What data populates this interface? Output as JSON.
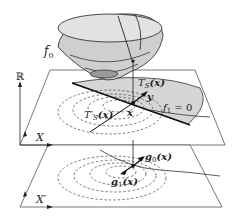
{
  "diagram": {
    "labels": {
      "f0": "f",
      "f0_sub": "0",
      "reals": "ℝ",
      "X": "X",
      "X_prime": "X′",
      "TS": "T",
      "TS_sub": "S",
      "TS_arg": "(x)",
      "TS_prime": "T′",
      "TS_prime_sub": "S",
      "TS_prime_arg": "(x)",
      "y": "y",
      "x": "x",
      "f1_eq": "f",
      "f1_sub": "1",
      "f1_rhs": " = 0",
      "g0": "g",
      "g0_sub": "0",
      "g0_arg": "(x)",
      "g1": "g",
      "g1_sub": "1",
      "g1_arg": "(x)"
    },
    "colors": {
      "surface_fill": "#cfcfcf",
      "surface_dark": "#9a9a9a",
      "halfplane_fill": "#d6d6d6",
      "line": "#222222",
      "plane_edge": "#555555"
    }
  }
}
